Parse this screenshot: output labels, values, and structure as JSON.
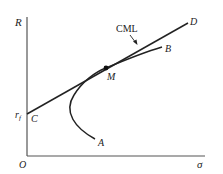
{
  "diagram": {
    "type": "capital-market-line",
    "axes": {
      "y_label": "R",
      "x_label": "σ",
      "origin_label": "O"
    },
    "risk_free": {
      "label_main": "r",
      "label_sub": "f"
    },
    "points": {
      "C": "C",
      "M": "M",
      "A": "A",
      "B": "B",
      "D": "D"
    },
    "line_label": "CML",
    "colors": {
      "stroke": "#222222",
      "axis": "#555555",
      "background": "#ffffff"
    }
  }
}
